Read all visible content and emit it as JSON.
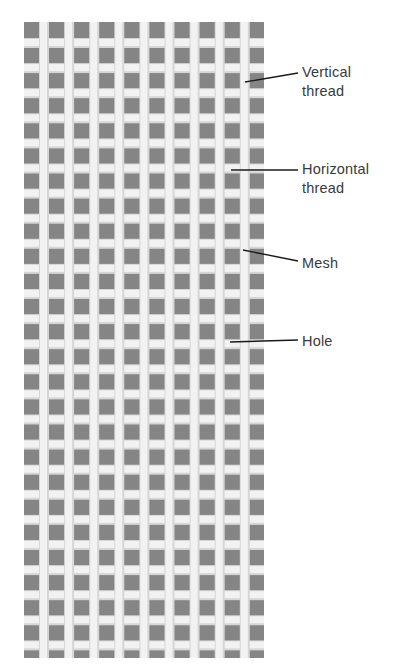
{
  "figure": {
    "colors": {
      "background": "#ffffff",
      "hole": "#858585",
      "thread": "#f2f2f2",
      "thread_shadow": "#d6d6d6",
      "leader_line": "#1a1a1a",
      "label_text": "#3a3a3a"
    },
    "mesh": {
      "x": 24,
      "y": 22,
      "width": 240,
      "height": 636,
      "pitch": 25.1
    }
  },
  "labels": [
    {
      "id": "vertical-thread",
      "text": "Vertical\nthread",
      "top": 63,
      "line": {
        "x1": 245,
        "y1": 82,
        "x2": 298,
        "y2": 73
      }
    },
    {
      "id": "horizontal-thread",
      "text": "Horizontal\nthread",
      "top": 160,
      "line": {
        "x1": 231,
        "y1": 170,
        "x2": 298,
        "y2": 170
      }
    },
    {
      "id": "mesh",
      "text": "Mesh",
      "top": 254,
      "line": {
        "x1": 243,
        "y1": 250,
        "x2": 298,
        "y2": 261
      }
    },
    {
      "id": "hole",
      "text": "Hole",
      "top": 332,
      "line": {
        "x1": 230,
        "y1": 342,
        "x2": 298,
        "y2": 340
      }
    }
  ]
}
